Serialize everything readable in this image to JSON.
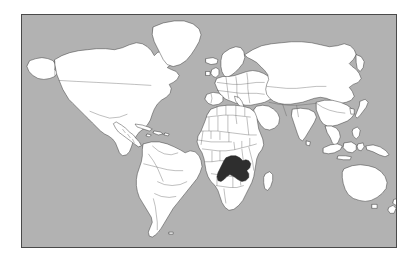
{
  "figure": {
    "kind": "world-locator-map",
    "projection": "Miller cylindrical",
    "caption": "",
    "frame": {
      "x": 21,
      "y": 14,
      "width": 376,
      "height": 234,
      "border_color": "#4a4a4a"
    }
  },
  "colors": {
    "ocean": "#b2b2b2",
    "land": "#ffffff",
    "coastline": "#2b2b2b",
    "country_border": "#555555",
    "highlight": "#2e2e2e",
    "page_background": "#ffffff"
  },
  "legend": {
    "highlight_label": "Zambia",
    "highlight_description": "Country shown in dark fill in south-central Africa"
  },
  "highlighted_regions": [
    {
      "name": "Zambia",
      "continent": "Africa",
      "fill": "#2e2e2e"
    }
  ],
  "landmasses": [
    {
      "name": "North America"
    },
    {
      "name": "South America"
    },
    {
      "name": "Greenland"
    },
    {
      "name": "Europe"
    },
    {
      "name": "Africa"
    },
    {
      "name": "Asia"
    },
    {
      "name": "Australia"
    },
    {
      "name": "New Zealand"
    },
    {
      "name": "Madagascar"
    },
    {
      "name": "Japan"
    },
    {
      "name": "Indonesia"
    },
    {
      "name": "Philippines"
    },
    {
      "name": "United Kingdom"
    },
    {
      "name": "Iceland"
    },
    {
      "name": "Sri Lanka"
    },
    {
      "name": "New Guinea"
    },
    {
      "name": "Cuba"
    }
  ],
  "map_features": {
    "graticule": false,
    "labels": false,
    "antarctica_shown": false,
    "internal_country_borders": true
  }
}
